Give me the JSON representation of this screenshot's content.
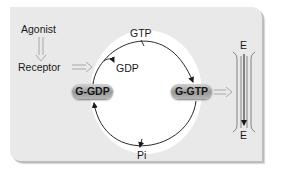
{
  "diagram": {
    "title": "",
    "labels": {
      "agonist": "Agonist",
      "receptor": "Receptor",
      "gtp": "GTP",
      "gdp": "GDP",
      "pi": "Pi",
      "effector_top": "E",
      "effector_bottom": "E"
    },
    "nodes": {
      "g_gdp": "G-GDP",
      "g_gtp": "G-GTP"
    },
    "edges": [
      {
        "from": "Agonist",
        "to": "Receptor",
        "style": "hollow-arrow"
      },
      {
        "from": "Receptor",
        "to": "cycle",
        "style": "hollow-arrow"
      },
      {
        "from": "G-GDP",
        "to": "G-GTP",
        "via": "GTP in / GDP out",
        "style": "curved-arrow"
      },
      {
        "from": "G-GTP",
        "to": "G-GDP",
        "via": "Pi out",
        "style": "curved-arrow"
      },
      {
        "from": "G-GTP",
        "to": "E",
        "style": "hollow-arrow"
      },
      {
        "from": "E",
        "to": "E",
        "style": "vertical-arrow"
      }
    ],
    "colors": {
      "panel": "#e9e9e9",
      "cycle_fill": "#ffffff",
      "line": "#2a2a2a",
      "hollow_arrow": "#a8a8a8",
      "pill": "#a3a3a3"
    }
  }
}
